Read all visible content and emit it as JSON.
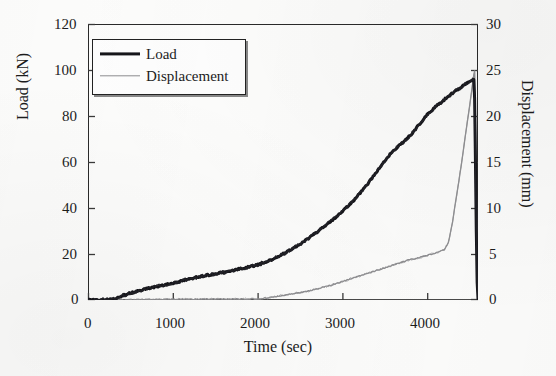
{
  "figure": {
    "background_color": "#fdfdfc",
    "style": "scanned-grayscale-figure"
  },
  "legend": {
    "position": "top-left-inside",
    "entries": [
      {
        "label": "Load",
        "color": "#15151a",
        "line_width": "thick"
      },
      {
        "label": "Displacement",
        "color": "#8d8d90",
        "line_width": "thin"
      }
    ]
  },
  "axes": {
    "x": {
      "title": "Time (sec)",
      "ticks": [
        "0",
        "1000",
        "2000",
        "3000",
        "4000"
      ],
      "tick_values": [
        0,
        1000,
        2000,
        3000,
        4000
      ],
      "min": 0,
      "max": 4600
    },
    "y_left": {
      "title": "Load (kN)",
      "ticks": [
        "0",
        "20",
        "40",
        "60",
        "80",
        "100",
        "120"
      ],
      "tick_values": [
        0,
        20,
        40,
        60,
        80,
        100,
        120
      ],
      "min": 0,
      "max": 120
    },
    "y_right": {
      "title": "Displacement (mm)",
      "ticks": [
        "0",
        "5",
        "10",
        "15",
        "20",
        "25",
        "30"
      ],
      "tick_values": [
        0,
        5,
        10,
        15,
        20,
        25,
        30
      ],
      "min": 0,
      "max": 30
    }
  },
  "chart_data": {
    "type": "line",
    "title": "",
    "subtitle": "",
    "xlabel": "Time (sec)",
    "ylabel": "Load (kN)",
    "y2label": "Displacement (mm)",
    "xlim": [
      0,
      4600
    ],
    "ylim": [
      0,
      120
    ],
    "y2lim": [
      0,
      30
    ],
    "grid": false,
    "legend_position": "upper left",
    "annotations": [],
    "series": [
      {
        "name": "Load",
        "axis": "left",
        "units": "kN",
        "color": "#15151a",
        "line_width": 3.0,
        "x": [
          0,
          100,
          200,
          300,
          350,
          400,
          500,
          600,
          700,
          800,
          900,
          1000,
          1100,
          1200,
          1300,
          1400,
          1500,
          1600,
          1700,
          1800,
          1900,
          2000,
          2100,
          2200,
          2300,
          2400,
          2500,
          2600,
          2700,
          2800,
          2900,
          3000,
          3100,
          3200,
          3300,
          3400,
          3500,
          3600,
          3700,
          3800,
          3900,
          4000,
          4100,
          4200,
          4300,
          4400,
          4500,
          4550,
          4560,
          4570,
          4580,
          4590,
          4600
        ],
        "y": [
          0,
          0,
          0.2,
          0.5,
          1.0,
          1.8,
          3.0,
          4.0,
          5.0,
          5.8,
          6.5,
          7.3,
          8.3,
          9.2,
          10.0,
          10.7,
          11.4,
          12.0,
          12.8,
          13.6,
          14.4,
          15.3,
          16.6,
          18.2,
          20.0,
          22.0,
          24.3,
          26.8,
          29.5,
          32.3,
          35.3,
          38.5,
          42.0,
          46.0,
          50.5,
          55.5,
          60.5,
          65.0,
          68.0,
          71.5,
          76.0,
          80.5,
          84.0,
          87.0,
          90.0,
          92.5,
          95.0,
          96.0,
          88.0,
          60.0,
          30.0,
          8.0,
          0.5
        ]
      },
      {
        "name": "Displacement",
        "axis": "right",
        "units": "mm",
        "color": "#8d8d90",
        "line_width": 1.3,
        "x": [
          0,
          200,
          400,
          600,
          800,
          1000,
          1200,
          1400,
          1600,
          1800,
          2000,
          2100,
          2200,
          2300,
          2400,
          2500,
          2600,
          2700,
          2800,
          2900,
          3000,
          3100,
          3200,
          3300,
          3400,
          3500,
          3600,
          3700,
          3800,
          3900,
          4000,
          4100,
          4200,
          4250,
          4300,
          4350,
          4400,
          4450,
          4500,
          4550,
          4560,
          4570,
          4580,
          4590,
          4600
        ],
        "y": [
          0,
          0,
          0.02,
          0.04,
          0.05,
          0.06,
          0.08,
          0.1,
          0.1,
          0.1,
          0.12,
          0.2,
          0.35,
          0.5,
          0.65,
          0.8,
          1.0,
          1.2,
          1.45,
          1.7,
          2.0,
          2.3,
          2.6,
          2.9,
          3.2,
          3.5,
          3.8,
          4.1,
          4.4,
          4.6,
          4.85,
          5.1,
          5.45,
          6.2,
          8.5,
          11.5,
          14.5,
          17.8,
          21.0,
          24.4,
          24.9,
          20.0,
          12.0,
          4.0,
          0.3
        ]
      }
    ],
    "key_observations": {
      "peak_load_kN": 96,
      "peak_load_time_sec": 4550,
      "peak_displacement_mm": 24.9,
      "failure_time_sec": 4560
    }
  }
}
